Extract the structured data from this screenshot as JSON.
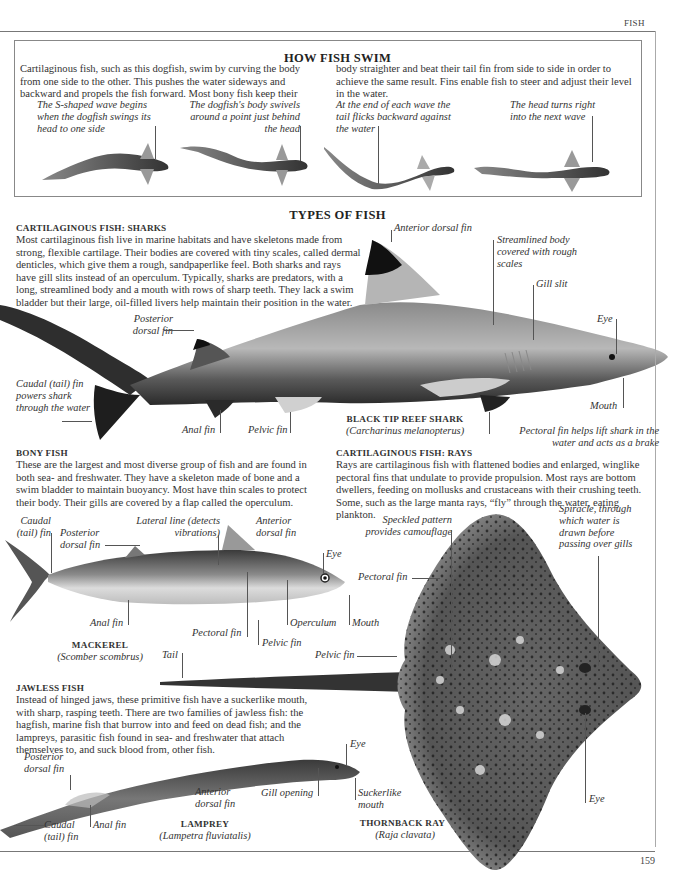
{
  "page": {
    "running_head": "FISH",
    "page_number": "159"
  },
  "how_fish_swim": {
    "title": "HOW FISH SWIM",
    "text_left": "Cartilaginous fish, such as this dogfish, swim by curving the body from one side to the other. This pushes the water sideways and backward and propels the fish forward. Most bony fish keep their",
    "text_right": "body straighter and beat their tail fin from side to side in order to achieve the same result. Fins enable fish to steer and adjust their level in the water.",
    "steps": [
      {
        "label": "The S-shaped wave begins when the dogfish swings its head to one side"
      },
      {
        "label": "The dogfish's body swivels around a point just behind the head"
      },
      {
        "label": "At the end of each wave the tail flicks backward against the water"
      },
      {
        "label": "The head turns right into the next wave"
      }
    ]
  },
  "types_of_fish": {
    "title": "TYPES OF FISH"
  },
  "sharks": {
    "heading": "CARTILAGINOUS FISH: SHARKS",
    "text": "Most cartilaginous fish live in marine habitats and have skeletons made from strong, flexible cartilage. Their bodies are covered with tiny scales, called dermal denticles, which give them a rough, sandpaperlike feel. Both sharks and rays have gill slits instead of an operculum. Typically, sharks are predators, with a long, streamlined body and a mouth with rows of sharp teeth. They lack a swim bladder but their large, oil-filled livers help maintain their position in the water.",
    "specimen_name": "BLACK TIP REEF SHARK",
    "specimen_scientific": "(Carcharinus melanopterus)",
    "labels": {
      "anterior_dorsal_fin": "Anterior dorsal fin",
      "streamlined_body": "Streamlined body covered with rough scales",
      "gill_slit": "Gill slit",
      "eye": "Eye",
      "posterior_dorsal_fin": "Posterior dorsal fin",
      "caudal_fin": "Caudal (tail) fin powers shark through the water",
      "anal_fin": "Anal fin",
      "pelvic_fin": "Pelvic fin",
      "mouth": "Mouth",
      "pectoral_fin": "Pectoral fin helps lift shark in the water and acts as a brake"
    }
  },
  "bony_fish": {
    "heading": "BONY FISH",
    "text": "These are the largest and most diverse group of fish and are found in both sea- and freshwater. They have a skeleton made of bone and a swim bladder to maintain buoyancy. Most have thin scales to protect their body. Their gills are covered by a flap called the operculum.",
    "specimen_name": "MACKEREL",
    "specimen_scientific": "(Scomber scombrus)",
    "labels": {
      "caudal_fin": "Caudal (tail) fin",
      "posterior_dorsal_fin": "Posterior dorsal fin",
      "lateral_line": "Lateral line (detects vibrations)",
      "anterior_dorsal_fin": "Anterior dorsal fin",
      "eye": "Eye",
      "anal_fin": "Anal fin",
      "pectoral_fin": "Pectoral fin",
      "pelvic_fin": "Pelvic fin",
      "operculum": "Operculum",
      "mouth": "Mouth"
    }
  },
  "rays": {
    "heading": "CARTILAGINOUS FISH: RAYS",
    "text": "Rays are cartilaginous fish with flattened bodies and enlarged, winglike pectoral fins that undulate to provide propulsion. Most rays are bottom dwellers, feeding on mollusks and crustaceans with their crushing teeth. Some, such as the large manta rays, “fly” through the water, eating plankton.",
    "specimen_name": "THORNBACK RAY",
    "specimen_scientific": "(Raja clavata)",
    "labels": {
      "speckled_pattern": "Speckled pattern provides camouflage",
      "spiracle": "Spiracle, through which water is drawn before passing over gills",
      "pectoral_fin": "Pectoral fin",
      "tail": "Tail",
      "pelvic_fin": "Pelvic fin",
      "eye": "Eye"
    }
  },
  "jawless_fish": {
    "heading": "JAWLESS FISH",
    "text": "Instead of hinged jaws, these primitive fish have a suckerlike mouth, with sharp, rasping teeth. There are two families of jawless fish: the hagfish, marine fish that burrow into and feed on dead fish; and the lampreys, parasitic fish found in sea- and freshwater that attach themselves to, and suck blood from, other fish.",
    "specimen_name": "LAMPREY",
    "specimen_scientific": "(Lampetra fluviatalis)",
    "labels": {
      "eye": "Eye",
      "posterior_dorsal_fin": "Posterior dorsal fin",
      "anterior_dorsal_fin": "Anterior dorsal fin",
      "gill_opening": "Gill opening",
      "suckerlike_mouth": "Suckerlike mouth",
      "caudal_fin": "Caudal (tail) fin",
      "anal_fin": "Anal fin"
    }
  }
}
